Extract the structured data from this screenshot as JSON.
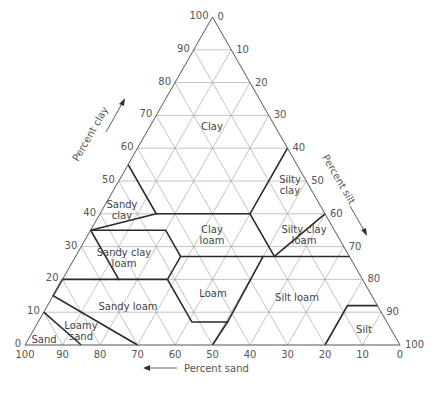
{
  "diagram": {
    "type": "ternary",
    "geometry": {
      "apex": [
        212.5,
        17
      ],
      "left": [
        25,
        345
      ],
      "right": [
        400,
        345
      ]
    },
    "axes": {
      "clay": {
        "label": "Percent clay",
        "ticks": [
          "0",
          "10",
          "20",
          "30",
          "40",
          "50",
          "60",
          "70",
          "80",
          "90",
          "100"
        ]
      },
      "silt": {
        "label": "Percent silt",
        "ticks": [
          "0",
          "10",
          "20",
          "30",
          "40",
          "50",
          "60",
          "70",
          "80",
          "90",
          "100"
        ]
      },
      "sand": {
        "label": "Percent sand",
        "ticks": [
          "100",
          "90",
          "80",
          "70",
          "60",
          "50",
          "40",
          "30",
          "20",
          "10",
          "0"
        ]
      }
    },
    "regions": [
      {
        "name": "Clay",
        "label_lines": [
          "Clay"
        ]
      },
      {
        "name": "Silty clay",
        "label_lines": [
          "Silty",
          "clay"
        ]
      },
      {
        "name": "Sandy clay",
        "label_lines": [
          "Sandy",
          "clay"
        ]
      },
      {
        "name": "Clay loam",
        "label_lines": [
          "Clay",
          "loam"
        ]
      },
      {
        "name": "Silty clay loam",
        "label_lines": [
          "Silty clay",
          "loam"
        ]
      },
      {
        "name": "Sandy clay loam",
        "label_lines": [
          "Sandy clay",
          "loam"
        ]
      },
      {
        "name": "Loam",
        "label_lines": [
          "Loam"
        ]
      },
      {
        "name": "Silt loam",
        "label_lines": [
          "Silt loam"
        ]
      },
      {
        "name": "Sandy loam",
        "label_lines": [
          "Sandy loam"
        ]
      },
      {
        "name": "Silt",
        "label_lines": [
          "Silt"
        ]
      },
      {
        "name": "Loamy sand",
        "label_lines": [
          "Loamy",
          "sand"
        ]
      },
      {
        "name": "Sand",
        "label_lines": [
          "Sand"
        ]
      }
    ],
    "boundaries_sand_clay": [
      [
        [
          45,
          55
        ],
        [
          45,
          40
        ],
        [
          65,
          35
        ],
        [
          65,
          20
        ],
        [
          80,
          20
        ],
        [
          85,
          15
        ],
        [
          70,
          0
        ]
      ],
      [
        [
          45,
          40
        ],
        [
          20,
          40
        ],
        [
          0,
          60
        ]
      ],
      [
        [
          20,
          40
        ],
        [
          20,
          27
        ],
        [
          45,
          27
        ],
        [
          52,
          20
        ],
        [
          52,
          7
        ],
        [
          42.5,
          7
        ],
        [
          50,
          0
        ]
      ],
      [
        [
          45,
          27
        ],
        [
          45,
          35
        ],
        [
          65,
          35
        ]
      ],
      [
        [
          20,
          27
        ],
        [
          0,
          27
        ]
      ],
      [
        [
          52,
          20
        ],
        [
          65,
          20
        ]
      ],
      [
        [
          42.5,
          7
        ],
        [
          23,
          27
        ]
      ],
      [
        [
          90,
          10
        ],
        [
          85,
          0
        ]
      ],
      [
        [
          20,
          0
        ],
        [
          8,
          12
        ],
        [
          0,
          12
        ]
      ],
      [
        [
          20,
          27
        ],
        [
          0,
          40
        ]
      ]
    ]
  }
}
